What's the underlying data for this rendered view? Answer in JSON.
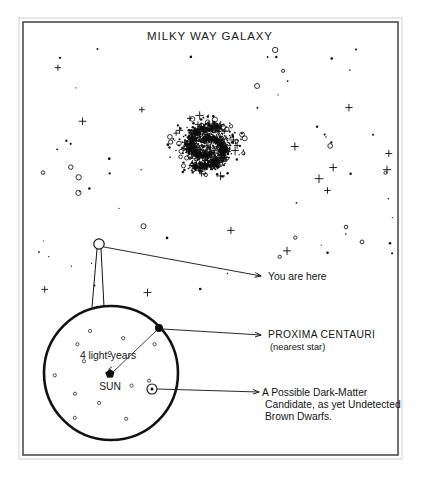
{
  "figure": {
    "title": "MILKY WAY GALAXY",
    "frame": {
      "x": 23,
      "y": 22,
      "width": 375,
      "height": 433,
      "stroke": "#4d4d4d"
    },
    "background": "#ffffff",
    "ink": "#111111"
  },
  "annotations": {
    "you_are_here": {
      "label": "You are here",
      "marker": {
        "x": 99,
        "y": 244,
        "radius": 5.2,
        "type": "open-circle"
      },
      "leader": {
        "x1": 104,
        "y1": 247,
        "x2": 261,
        "y2": 276
      },
      "text_x": 268,
      "text_y": 280
    },
    "proxima": {
      "label": "PROXIMA CENTAURI",
      "sublabel": "(nearest star)",
      "marker": {
        "x": 159,
        "y": 328,
        "radius": 4.0,
        "type": "filled-dot"
      },
      "leader": {
        "x1": 163,
        "y1": 329,
        "x2": 261,
        "y2": 335
      },
      "text_x": 268,
      "text_y": 338,
      "sub_y": 350
    },
    "brown_dwarf": {
      "label_line1": "A Possible Dark-Matter",
      "label_line2": "Candidate, as yet Undetected",
      "label_line3": "Brown Dwarfs.",
      "marker": {
        "x": 152,
        "y": 389,
        "radius": 5.0,
        "type": "ringed-dot"
      },
      "leader": {
        "x1": 157,
        "y1": 389,
        "x2": 259,
        "y2": 392
      },
      "text_x": 262,
      "text_y": 396,
      "line2_y": 408,
      "line3_y": 420
    },
    "sun": {
      "label": "SUN",
      "marker": {
        "x": 110,
        "y": 375,
        "type": "sun-blob"
      },
      "text_x": 110,
      "text_y": 390
    },
    "distance": {
      "label": "4 light-years",
      "text_x": 108,
      "text_y": 359,
      "leader": {
        "x1": 113,
        "y1": 372,
        "x2": 157,
        "y2": 330
      }
    }
  },
  "inset": {
    "name": "solar-neighborhood-detail",
    "center_x": 111,
    "center_y": 373,
    "radius": 67,
    "cone": [
      {
        "x1": 101,
        "y1": 249,
        "x2": 104,
        "y2": 307
      },
      {
        "x1": 97,
        "y1": 249,
        "x2": 92,
        "y2": 307
      }
    ]
  },
  "chart_data": {
    "type": "scatter",
    "title": "MILKY WAY GALAXY",
    "galaxy": {
      "center_x": 207,
      "center_y": 147,
      "core_radius": 22,
      "arm_count": 2,
      "marker_types": [
        "dot",
        "open-circle",
        "plus-star"
      ],
      "extent": {
        "x_min": 28,
        "x_max": 396,
        "y_min": 46,
        "y_max": 300
      }
    },
    "inset_stars": {
      "count": 13,
      "marker_type": "open-circle",
      "scale_note": "4 light-years from SUN to PROXIMA CENTAURI"
    },
    "legend": [
      "You are here",
      "PROXIMA CENTAURI (nearest star)",
      "A Possible Dark-Matter Candidate, as yet Undetected Brown Dwarfs.",
      "SUN",
      "4 light-years"
    ]
  }
}
